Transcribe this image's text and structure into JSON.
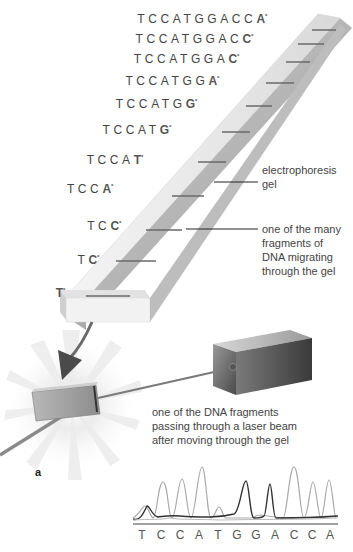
{
  "sequences": [
    {
      "prefix": "TCCATGGACC",
      "terminal": "A",
      "marker": "*"
    },
    {
      "prefix": "TCCATGGAC",
      "terminal": "C",
      "marker": "*"
    },
    {
      "prefix": "TCCATGGA",
      "terminal": "C",
      "marker": "*"
    },
    {
      "prefix": "TCCATGG",
      "terminal": "A",
      "marker": "*"
    },
    {
      "prefix": "TCCATG",
      "terminal": "G",
      "marker": "*"
    },
    {
      "prefix": "TCCAT",
      "terminal": "G",
      "marker": "*"
    },
    {
      "prefix": "TCCA",
      "terminal": "T",
      "marker": "*"
    },
    {
      "prefix": "TCC",
      "terminal": "A",
      "marker": "*"
    },
    {
      "prefix": "TC",
      "terminal": "C",
      "marker": "*"
    },
    {
      "prefix": "T",
      "terminal": "C",
      "marker": "*"
    },
    {
      "prefix": "",
      "terminal": "T",
      "marker": "*"
    }
  ],
  "labels": {
    "gel": "electrophoresis gel",
    "fragment": "one of the many fragments of DNA migrating through the gel",
    "laser": "one of the DNA fragments passing through a laser beam after moving through the gel",
    "panel": "a"
  },
  "labels_lines": {
    "gel": [
      "electrophoresis",
      "gel"
    ],
    "fragment": [
      "one of the many",
      "fragments of",
      "DNA migrating",
      "through the gel"
    ],
    "laser": [
      "one of the DNA fragments",
      "passing through a laser beam",
      "after moving through the gel"
    ]
  },
  "chromatogram": {
    "bases": [
      "T",
      "C",
      "C",
      "A",
      "T",
      "G",
      "G",
      "A",
      "C",
      "C",
      "A"
    ],
    "peak_heights": [
      0.25,
      0.75,
      0.8,
      1.0,
      0.25,
      0.8,
      0.75,
      1.0,
      0.75,
      0.78,
      1.0
    ],
    "peak_shade": [
      "light",
      "light",
      "light",
      "light",
      "light",
      "dark",
      "dark",
      "light",
      "light",
      "light",
      "light"
    ]
  },
  "colors": {
    "gel": "#e8e8e8",
    "gel_edge": "#c4c4c4",
    "band": "#6a6a6a",
    "arrow": "#4a4a4a",
    "beam": "#7a7a7a",
    "box": "#5a5a5a",
    "peak_light": "#a9a9a9",
    "peak_dark": "#333333"
  }
}
